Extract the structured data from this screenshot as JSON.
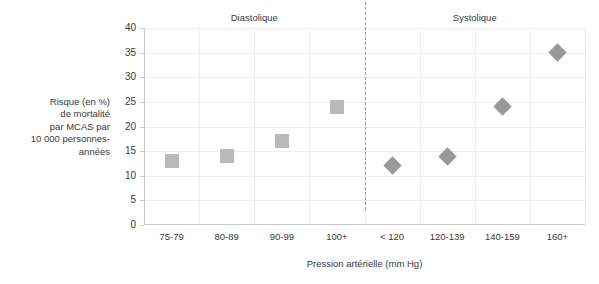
{
  "chart_data": {
    "type": "scatter",
    "title": "",
    "xlabel": "Pression artérielle (mm Hg)",
    "ylabel": "Risque (en %) de mortalité par MCAS par 10 000 personnes-années",
    "ylim": [
      0,
      40
    ],
    "yticks": [
      0,
      5,
      10,
      15,
      20,
      25,
      30,
      35,
      40
    ],
    "ytick_labels": [
      "0",
      "5",
      "10",
      "15",
      "20",
      "25",
      "30",
      "35",
      "40"
    ],
    "categories": [
      "75-79",
      "80-89",
      "90-99",
      "100+",
      "< 120",
      "120-139",
      "140-159",
      "160+"
    ],
    "grid": true,
    "legend": "none",
    "group_headers": [
      {
        "label": "Diastolique",
        "categories": [
          "75-79",
          "80-89",
          "90-99",
          "100+"
        ]
      },
      {
        "label": "Systolique",
        "categories": [
          "< 120",
          "120-139",
          "140-159",
          "160+"
        ]
      }
    ],
    "divider": {
      "style": "dashed",
      "after_category": "100+"
    },
    "series": [
      {
        "name": "Diastolique",
        "marker": "square",
        "color": "#b9b9b9",
        "points": [
          {
            "x": "75-79",
            "y": 13
          },
          {
            "x": "80-89",
            "y": 14
          },
          {
            "x": "90-99",
            "y": 17
          },
          {
            "x": "100+",
            "y": 24
          }
        ]
      },
      {
        "name": "Systolique",
        "marker": "diamond",
        "color": "#999999",
        "points": [
          {
            "x": "< 120",
            "y": 12
          },
          {
            "x": "120-139",
            "y": 14
          },
          {
            "x": "140-159",
            "y": 24
          },
          {
            "x": "160+",
            "y": 35
          }
        ]
      }
    ]
  },
  "axis": {
    "y_title_text": "Risque (en %)\nde mortalité\npar MCAS par\n10 000 personnes-\nannées",
    "x_title_text": "Pression artérielle (mm Hg)"
  },
  "colors": {
    "grid": "#ededed",
    "axis": "#c9c9c9",
    "divider": "#a0a0a0",
    "text": "#3a3a3a",
    "background": "#ffffff",
    "square_marker": "#b9b9b9",
    "diamond_marker": "#999999"
  }
}
